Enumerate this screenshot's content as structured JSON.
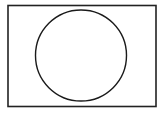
{
  "diagram": {
    "shapes": [
      {
        "type": "rectangle",
        "x": 8,
        "y": 5.5,
        "width": 148,
        "height": 101,
        "stroke": "#222222",
        "fill": "#ffffff",
        "stroke_width": 1.6
      },
      {
        "type": "circle",
        "cx": 81,
        "cy": 55.5,
        "r": 45.5,
        "stroke": "#1a1a1a",
        "fill": "#ffffff",
        "stroke_width": 1.4
      }
    ]
  }
}
